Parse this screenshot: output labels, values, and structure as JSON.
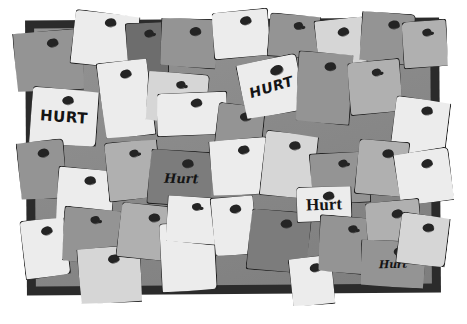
{
  "scene": {
    "title": "Corkboard covered with pinned paper notes",
    "board": {
      "frame_color": "#2b2b2b",
      "surface_color": "#8c8c8c",
      "pin_color": "#242424"
    },
    "palette": {
      "white": "#ececec",
      "light": "#d6d6d6",
      "mid": "#b0b0b0",
      "grey": "#949494",
      "dark": "#7c7c7c",
      "darker": "#6d6d6d",
      "outline": "#1d1d1d",
      "background": "#ffffff"
    },
    "labels": {
      "block": "HURT",
      "slant": "HURT",
      "hand": "Hurt",
      "serif": "Hurt",
      "script": "Hurt"
    },
    "notes": [
      {
        "x": 14,
        "y": 30,
        "w": 70,
        "h": 62,
        "tone": "t-grey",
        "rot": -4,
        "corner": "c1",
        "curl": "curl-a",
        "pin": {
          "x": 33,
          "y": 8,
          "size": ""
        },
        "label": null
      },
      {
        "x": 72,
        "y": 12,
        "w": 66,
        "h": 55,
        "tone": "t-white",
        "rot": 6,
        "corner": "c2",
        "curl": "curl-b",
        "pin": {
          "x": 30,
          "y": 5,
          "size": ""
        },
        "label": null
      },
      {
        "x": 126,
        "y": 22,
        "w": 42,
        "h": 52,
        "tone": "t-darker",
        "rot": -3,
        "corner": "c3",
        "curl": "curl-c",
        "pin": {
          "x": 18,
          "y": 7,
          "size": "sm"
        },
        "label": null
      },
      {
        "x": 160,
        "y": 18,
        "w": 58,
        "h": 50,
        "tone": "t-grey",
        "rot": 3,
        "corner": "c1",
        "curl": "curl-a",
        "pin": {
          "x": 28,
          "y": 8,
          "size": ""
        },
        "label": null
      },
      {
        "x": 212,
        "y": 10,
        "w": 58,
        "h": 48,
        "tone": "t-white",
        "rot": -5,
        "corner": "c4",
        "curl": "curl-d",
        "pin": {
          "x": 28,
          "y": 6,
          "size": ""
        },
        "label": null
      },
      {
        "x": 268,
        "y": 14,
        "w": 52,
        "h": 44,
        "tone": "t-grey",
        "rot": 4,
        "corner": "c2",
        "curl": "curl-b",
        "pin": {
          "x": 24,
          "y": 7,
          "size": "sm"
        },
        "label": null
      },
      {
        "x": 316,
        "y": 18,
        "w": 50,
        "h": 56,
        "tone": "t-light",
        "rot": -6,
        "corner": "c3",
        "curl": "curl-c",
        "pin": {
          "x": 22,
          "y": 9,
          "size": ""
        },
        "label": null
      },
      {
        "x": 360,
        "y": 12,
        "w": 54,
        "h": 52,
        "tone": "t-grey",
        "rot": 5,
        "corner": "c1",
        "curl": "curl-a",
        "pin": {
          "x": 26,
          "y": 7,
          "size": ""
        },
        "label": null
      },
      {
        "x": 402,
        "y": 20,
        "w": 46,
        "h": 48,
        "tone": "t-mid",
        "rot": -4,
        "corner": "c4",
        "curl": "curl-d",
        "pin": {
          "x": 20,
          "y": 8,
          "size": "sm"
        },
        "label": null
      },
      {
        "x": 30,
        "y": 88,
        "w": 68,
        "h": 58,
        "tone": "t-white",
        "rot": 4,
        "corner": "c2",
        "curl": "curl-b",
        "pin": {
          "x": 30,
          "y": 7,
          "size": ""
        },
        "label": {
          "text": "block",
          "style": "style-block"
        }
      },
      {
        "x": 100,
        "y": 60,
        "w": 52,
        "h": 78,
        "tone": "t-white",
        "rot": -7,
        "corner": "c3",
        "curl": "curl-c",
        "pin": {
          "x": 22,
          "y": 9,
          "size": ""
        },
        "label": null
      },
      {
        "x": 146,
        "y": 72,
        "w": 62,
        "h": 52,
        "tone": "t-light",
        "rot": 5,
        "corner": "c1",
        "curl": "curl-a",
        "pin": {
          "x": 28,
          "y": 8,
          "size": "sm"
        },
        "label": null
      },
      {
        "x": 156,
        "y": 92,
        "w": 72,
        "h": 44,
        "tone": "t-white",
        "rot": -2,
        "corner": "c4",
        "curl": "curl-d",
        "pin": {
          "x": 34,
          "y": 6,
          "size": ""
        },
        "label": null
      },
      {
        "x": 216,
        "y": 104,
        "w": 48,
        "h": 42,
        "tone": "t-grey",
        "rot": 6,
        "corner": "c2",
        "curl": "curl-b",
        "pin": {
          "x": 22,
          "y": 7,
          "size": ""
        },
        "label": null
      },
      {
        "x": 240,
        "y": 58,
        "w": 62,
        "h": 58,
        "tone": "t-white",
        "rot": -11,
        "corner": "c1",
        "curl": "curl-a",
        "pin": {
          "x": 32,
          "y": 8,
          "size": "lg"
        },
        "label": {
          "text": "slant",
          "style": "style-slant"
        }
      },
      {
        "x": 296,
        "y": 52,
        "w": 56,
        "h": 72,
        "tone": "t-grey",
        "rot": 4,
        "corner": "c3",
        "curl": "curl-c",
        "pin": {
          "x": 26,
          "y": 9,
          "size": ""
        },
        "label": null
      },
      {
        "x": 348,
        "y": 60,
        "w": 54,
        "h": 54,
        "tone": "t-mid",
        "rot": -5,
        "corner": "c4",
        "curl": "curl-d",
        "pin": {
          "x": 24,
          "y": 8,
          "size": "sm"
        },
        "label": null
      },
      {
        "x": 392,
        "y": 98,
        "w": 56,
        "h": 62,
        "tone": "t-white",
        "rot": 7,
        "corner": "c2",
        "curl": "curl-b",
        "pin": {
          "x": 26,
          "y": 7,
          "size": ""
        },
        "label": null
      },
      {
        "x": 18,
        "y": 140,
        "w": 48,
        "h": 60,
        "tone": "t-grey",
        "rot": -5,
        "corner": "c1",
        "curl": "curl-a",
        "pin": {
          "x": 20,
          "y": 8,
          "size": ""
        },
        "label": null
      },
      {
        "x": 56,
        "y": 168,
        "w": 58,
        "h": 56,
        "tone": "t-white",
        "rot": 5,
        "corner": "c3",
        "curl": "curl-c",
        "pin": {
          "x": 26,
          "y": 7,
          "size": ""
        },
        "label": null
      },
      {
        "x": 106,
        "y": 140,
        "w": 54,
        "h": 60,
        "tone": "t-mid",
        "rot": -6,
        "corner": "c2",
        "curl": "curl-b",
        "pin": {
          "x": 24,
          "y": 9,
          "size": "sm"
        },
        "label": null
      },
      {
        "x": 148,
        "y": 150,
        "w": 66,
        "h": 56,
        "tone": "t-dark",
        "rot": 4,
        "corner": "c4",
        "curl": "curl-d",
        "pin": {
          "x": 32,
          "y": 8,
          "size": ""
        },
        "label": {
          "text": "hand",
          "style": "style-hand"
        }
      },
      {
        "x": 210,
        "y": 138,
        "w": 60,
        "h": 58,
        "tone": "t-white",
        "rot": -4,
        "corner": "c1",
        "curl": "curl-a",
        "pin": {
          "x": 28,
          "y": 7,
          "size": ""
        },
        "label": null
      },
      {
        "x": 262,
        "y": 132,
        "w": 54,
        "h": 66,
        "tone": "t-light",
        "rot": 6,
        "corner": "c2",
        "curl": "curl-b",
        "pin": {
          "x": 24,
          "y": 8,
          "size": ""
        },
        "label": null
      },
      {
        "x": 310,
        "y": 152,
        "w": 60,
        "h": 52,
        "tone": "t-grey",
        "rot": -3,
        "corner": "c3",
        "curl": "curl-c",
        "pin": {
          "x": 28,
          "y": 7,
          "size": "sm"
        },
        "label": null
      },
      {
        "x": 356,
        "y": 140,
        "w": 52,
        "h": 56,
        "tone": "t-mid",
        "rot": 5,
        "corner": "c4",
        "curl": "curl-d",
        "pin": {
          "x": 24,
          "y": 8,
          "size": ""
        },
        "label": null
      },
      {
        "x": 396,
        "y": 150,
        "w": 56,
        "h": 54,
        "tone": "t-white",
        "rot": -8,
        "corner": "c1",
        "curl": "curl-a",
        "pin": {
          "x": 26,
          "y": 9,
          "size": ""
        },
        "label": null
      },
      {
        "x": 22,
        "y": 218,
        "w": 46,
        "h": 60,
        "tone": "t-white",
        "rot": -7,
        "corner": "c2",
        "curl": "curl-b",
        "pin": {
          "x": 20,
          "y": 8,
          "size": ""
        },
        "label": null
      },
      {
        "x": 62,
        "y": 208,
        "w": 58,
        "h": 56,
        "tone": "t-grey",
        "rot": 5,
        "corner": "c3",
        "curl": "curl-c",
        "pin": {
          "x": 26,
          "y": 7,
          "size": "sm"
        },
        "label": null
      },
      {
        "x": 78,
        "y": 246,
        "w": 64,
        "h": 58,
        "tone": "t-light",
        "rot": -4,
        "corner": "c1",
        "curl": "curl-a",
        "pin": {
          "x": 30,
          "y": 8,
          "size": ""
        },
        "label": null
      },
      {
        "x": 118,
        "y": 204,
        "w": 60,
        "h": 56,
        "tone": "t-mid",
        "rot": 6,
        "corner": "c4",
        "curl": "curl-d",
        "pin": {
          "x": 28,
          "y": 8,
          "size": ""
        },
        "label": null
      },
      {
        "x": 160,
        "y": 222,
        "w": 56,
        "h": 70,
        "tone": "t-white",
        "rot": -3,
        "corner": "c2",
        "curl": "curl-b",
        "pin": {
          "x": 26,
          "y": 7,
          "size": ""
        },
        "label": null
      },
      {
        "x": 166,
        "y": 196,
        "w": 54,
        "h": 48,
        "tone": "t-white",
        "rot": 4,
        "corner": "c1",
        "curl": "curl-a",
        "pin": {
          "x": 24,
          "y": 6,
          "size": "sm"
        },
        "label": null
      },
      {
        "x": 212,
        "y": 196,
        "w": 44,
        "h": 60,
        "tone": "t-white",
        "rot": -5,
        "corner": "c3",
        "curl": "curl-c",
        "pin": {
          "x": 18,
          "y": 8,
          "size": ""
        },
        "label": null
      },
      {
        "x": 248,
        "y": 210,
        "w": 62,
        "h": 62,
        "tone": "t-dark",
        "rot": 5,
        "corner": "c4",
        "curl": "curl-d",
        "pin": {
          "x": 30,
          "y": 8,
          "size": ""
        },
        "label": null
      },
      {
        "x": 290,
        "y": 256,
        "w": 44,
        "h": 50,
        "tone": "t-white",
        "rot": -6,
        "corner": "c1",
        "curl": "curl-a",
        "pin": {
          "x": 20,
          "y": 7,
          "size": ""
        },
        "label": null
      },
      {
        "x": 296,
        "y": 186,
        "w": 56,
        "h": 36,
        "tone": "t-white",
        "rot": -2,
        "corner": "c2",
        "curl": "curl-b",
        "pin": {
          "x": 26,
          "y": 5,
          "size": ""
        },
        "label": {
          "text": "serif",
          "style": "style-serif"
        }
      },
      {
        "x": 318,
        "y": 216,
        "w": 58,
        "h": 58,
        "tone": "t-grey",
        "rot": 4,
        "corner": "c3",
        "curl": "curl-c",
        "pin": {
          "x": 28,
          "y": 8,
          "size": "sm"
        },
        "label": null
      },
      {
        "x": 366,
        "y": 200,
        "w": 56,
        "h": 62,
        "tone": "t-mid",
        "rot": -5,
        "corner": "c4",
        "curl": "curl-d",
        "pin": {
          "x": 26,
          "y": 9,
          "size": ""
        },
        "label": null
      },
      {
        "x": 360,
        "y": 240,
        "w": 66,
        "h": 48,
        "tone": "t-grey",
        "rot": 3,
        "corner": "c1",
        "curl": "curl-a",
        "pin": {
          "x": 32,
          "y": 6,
          "size": ""
        },
        "label": {
          "text": "script",
          "style": "style-script"
        }
      },
      {
        "x": 398,
        "y": 214,
        "w": 50,
        "h": 52,
        "tone": "t-light",
        "rot": 7,
        "corner": "c2",
        "curl": "curl-b",
        "pin": {
          "x": 22,
          "y": 8,
          "size": ""
        },
        "label": null
      }
    ]
  }
}
